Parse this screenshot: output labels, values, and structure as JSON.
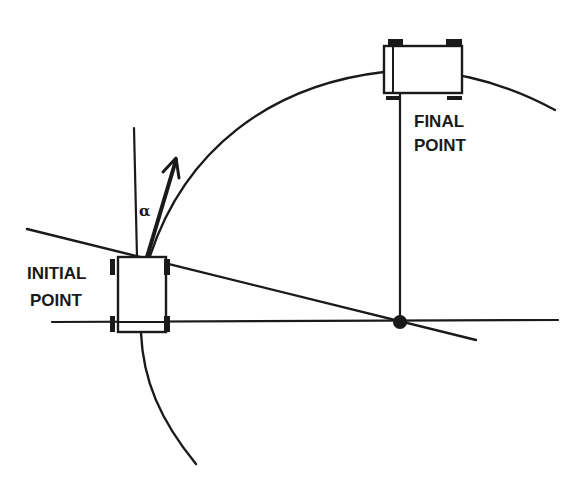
{
  "diagram": {
    "type": "geometric-path-diagram",
    "labels": {
      "initial_line1": "INITIAL",
      "initial_line2": "POINT",
      "final_line1": "FINAL",
      "final_line2": "POINT",
      "angle": "α"
    },
    "colors": {
      "ink": "#1a1a1a",
      "background": "#ffffff"
    },
    "elements": {
      "initial_vehicle": {
        "x": 118,
        "y": 257,
        "width": 48,
        "height": 75
      },
      "final_vehicle": {
        "x": 384,
        "y": 46,
        "width": 78,
        "height": 47
      },
      "center_point": {
        "x": 400,
        "y": 322,
        "r": 7
      },
      "horizontal_axis": {
        "x1": 52,
        "y1": 322,
        "x2": 558,
        "y2": 320
      },
      "tangent_line": {
        "x1": 27,
        "y1": 229,
        "x2": 476,
        "y2": 340
      },
      "vertical_reference": {
        "x1": 134,
        "y1": 128,
        "x2": 137,
        "y2": 257
      },
      "vertical_radius": {
        "x1": 400,
        "y1": 93,
        "x2": 400,
        "y2": 322
      },
      "heading_arrow": {
        "x1": 147,
        "y1": 257,
        "x2": 176,
        "y2": 158
      }
    }
  }
}
